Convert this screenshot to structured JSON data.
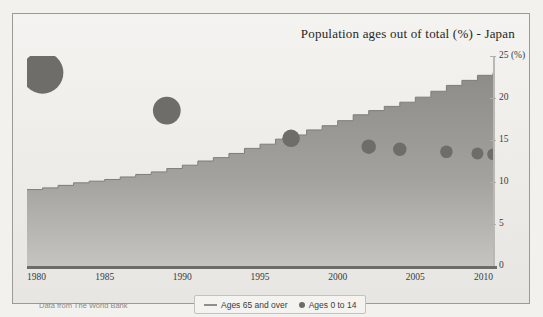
{
  "figure": {
    "title": "Population ages out of total (%) - Japan",
    "source_note": "Data from The World Bank",
    "background_color": "#efeeea",
    "frame_color": "#9a9a96"
  },
  "legend": {
    "position": "bottom-center",
    "entries": [
      {
        "marker": "line",
        "label": "Ages 65 and over",
        "color": "#8f8e8a"
      },
      {
        "marker": "dot",
        "label": "Ages 0 to 14",
        "color": "#6c6b68"
      }
    ]
  },
  "axes": {
    "x_ticks": [
      "1980",
      "1985",
      "1990",
      "1995",
      "2000",
      "2005",
      "2010"
    ],
    "y_ticks": [
      "0",
      "5",
      "10",
      "15",
      "20",
      "25 (%)"
    ],
    "y_unit_label": "(%)",
    "x_range": [
      1980,
      2010
    ],
    "y_range": [
      0,
      25
    ],
    "grid": false
  },
  "chart_data": {
    "type": "area",
    "title": "Population ages out of total (%) - Japan",
    "subtitle": "",
    "xlabel": "",
    "ylabel": "",
    "xlim": [
      1980,
      2010
    ],
    "ylim": [
      0,
      25
    ],
    "grid": false,
    "legend_position": "bottom-center",
    "x": [
      1980,
      1981,
      1982,
      1983,
      1984,
      1985,
      1986,
      1987,
      1988,
      1989,
      1990,
      1991,
      1992,
      1993,
      1994,
      1995,
      1996,
      1997,
      1998,
      1999,
      2000,
      2001,
      2002,
      2003,
      2004,
      2005,
      2006,
      2007,
      2008,
      2009,
      2010
    ],
    "series": [
      {
        "name": "Ages 65 and over",
        "render": "area",
        "color": "#8c8b87",
        "values": [
          9.1,
          9.3,
          9.6,
          9.9,
          10.1,
          10.3,
          10.6,
          10.9,
          11.2,
          11.6,
          12.0,
          12.5,
          12.9,
          13.4,
          14.0,
          14.5,
          15.1,
          15.6,
          16.2,
          16.7,
          17.3,
          18.0,
          18.5,
          19.0,
          19.5,
          20.1,
          20.8,
          21.5,
          22.1,
          22.7,
          23.0
        ]
      },
      {
        "name": "Ages 0 to 14",
        "render": "bubble",
        "color": "#6e6d6a",
        "points": [
          {
            "x": 1981,
            "y": 23.0,
            "size": 23.0,
            "clipped_top": true
          },
          {
            "x": 1989,
            "y": 18.5,
            "size": 18.5,
            "clipped_top": false
          },
          {
            "x": 1997,
            "y": 15.2,
            "size": 15.2,
            "clipped_top": false
          },
          {
            "x": 2002,
            "y": 14.2,
            "size": 14.2,
            "clipped_top": false
          },
          {
            "x": 2004,
            "y": 13.9,
            "size": 13.9,
            "clipped_top": false
          },
          {
            "x": 2007,
            "y": 13.6,
            "size": 13.6,
            "clipped_top": false
          },
          {
            "x": 2009,
            "y": 13.4,
            "size": 13.4,
            "clipped_top": false
          },
          {
            "x": 2010,
            "y": 13.3,
            "size": 13.3,
            "clipped_right": true
          }
        ]
      }
    ]
  }
}
